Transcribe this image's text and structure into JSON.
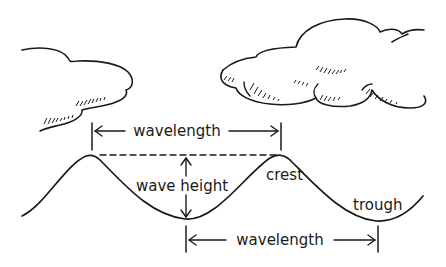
{
  "diagram": {
    "type": "wave-anatomy",
    "labels": {
      "wavelength_top": "wavelength",
      "wavelength_bottom": "wavelength",
      "wave_height": "wave height",
      "crest": "crest",
      "trough": "trough"
    },
    "elements": {
      "clouds": [
        "left-cloud",
        "right-cloud"
      ],
      "wave": "sinusoidal-wave-line",
      "reference_line": "dashed-crest-line",
      "dimension_arrows": [
        "wavelength-top-arrow",
        "wavelength-bottom-arrow",
        "wave-height-arrow"
      ]
    },
    "colors": {
      "ink": "#1a1a1a",
      "background": "#ffffff"
    }
  }
}
